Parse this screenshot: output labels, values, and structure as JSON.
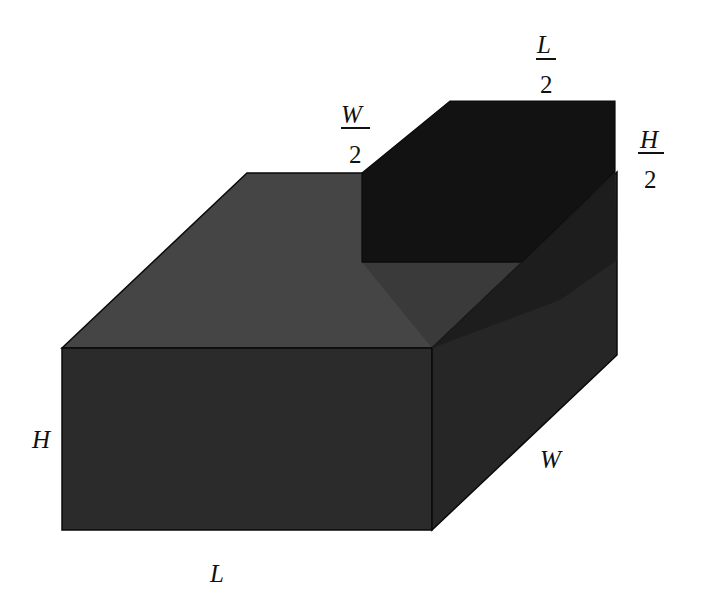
{
  "diagram": {
    "colors": {
      "background": "#ffffff",
      "top_face": "#454545",
      "front_face": "#2b2b2b",
      "side_face": "#262626",
      "notch_back_wall": "#121212",
      "notch_floor": "#333333",
      "notch_side_wall": "#1c1c1c",
      "edge": "#0a0a0a"
    },
    "labels": {
      "height": "H",
      "length": "L",
      "width": "W",
      "half_length": {
        "numerator": "L",
        "denominator": "2"
      },
      "half_width": {
        "numerator": "W",
        "denominator": "2"
      },
      "half_height": {
        "numerator": "H",
        "denominator": "2"
      }
    }
  }
}
